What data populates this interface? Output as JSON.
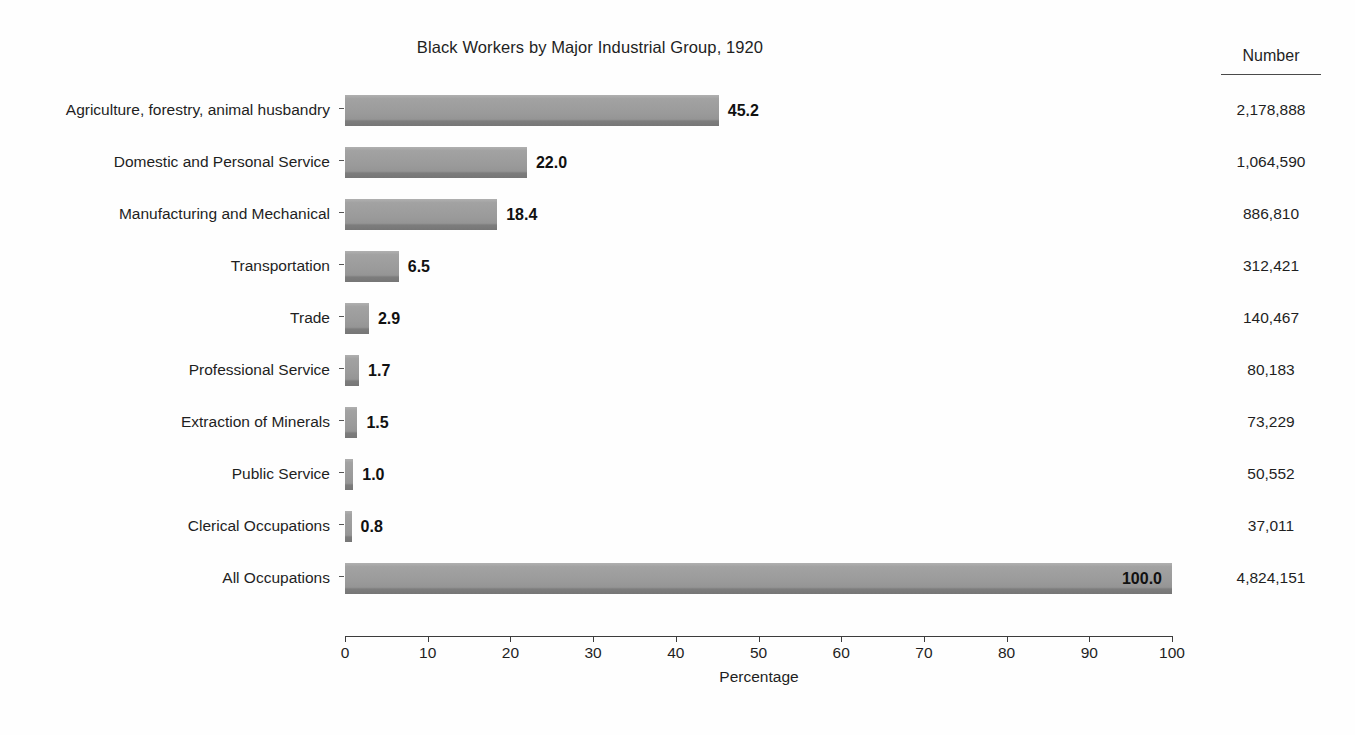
{
  "chart_data": {
    "type": "bar",
    "orientation": "horizontal",
    "title": "Black Workers by Major Industrial Group, 1920",
    "xlabel": "Percentage",
    "ylabel": "",
    "xlim": [
      0,
      100
    ],
    "xticks": [
      0,
      10,
      20,
      30,
      40,
      50,
      60,
      70,
      80,
      90,
      100
    ],
    "grid": false,
    "legend": null,
    "bar_color": "#9b9b9b",
    "categories": [
      "Agriculture, forestry, animal husbandry",
      "Domestic and Personal Service",
      "Manufacturing and Mechanical",
      "Transportation",
      "Trade",
      "Professional Service",
      "Extraction of Minerals",
      "Public Service",
      "Clerical Occupations",
      "All Occupations"
    ],
    "values": [
      45.2,
      22.0,
      18.4,
      6.5,
      2.9,
      1.7,
      1.5,
      1.0,
      0.8,
      100.0
    ],
    "value_labels": [
      "45.2",
      "22.0",
      "18.4",
      "6.5",
      "2.9",
      "1.7",
      "1.5",
      "1.0",
      "0.8",
      "100.0"
    ],
    "label_placement": [
      "outside",
      "outside",
      "outside",
      "outside",
      "outside",
      "outside",
      "outside",
      "outside",
      "outside",
      "inside"
    ],
    "side_column": {
      "header": "Number",
      "values": [
        "2,178,888",
        "1,064,590",
        "886,810",
        "312,421",
        "140,467",
        "80,183",
        "73,229",
        "50,552",
        "37,011",
        "4,824,151"
      ]
    }
  },
  "page": {
    "bottom_artifact": ""
  }
}
